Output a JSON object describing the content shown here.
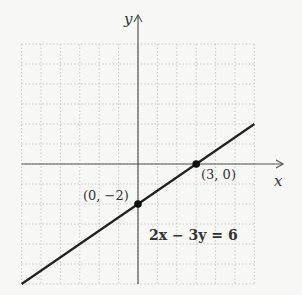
{
  "chart_data": {
    "type": "line",
    "title": "",
    "xlabel": "x",
    "ylabel": "y",
    "xlim": [
      -6,
      6
    ],
    "ylim": [
      -6,
      6
    ],
    "grid": true,
    "equation": "2x − 3y = 6",
    "series": [
      {
        "name": "2x − 3y = 6",
        "x": [
          -6,
          6
        ],
        "y": [
          -6,
          2
        ]
      }
    ],
    "points": [
      {
        "label": "(0, −2)",
        "x": 0,
        "y": -2
      },
      {
        "label": "(3, 0)",
        "x": 3,
        "y": 0
      }
    ]
  },
  "labels": {
    "x_axis": "x",
    "y_axis": "y",
    "point_a": "(0, −2)",
    "point_b": "(3, 0)",
    "equation": "2x − 3y = 6"
  }
}
